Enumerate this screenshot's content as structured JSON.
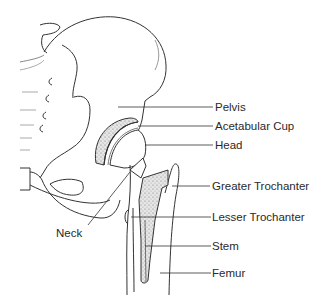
{
  "diagram": {
    "labels": [
      {
        "id": "pelvis",
        "text": "Pelvis"
      },
      {
        "id": "acetabular-cup",
        "text": "Acetabular Cup"
      },
      {
        "id": "head",
        "text": "Head"
      },
      {
        "id": "greater-trochanter",
        "text": "Greater Trochanter"
      },
      {
        "id": "lesser-trochanter",
        "text": "Lesser Trochanter"
      },
      {
        "id": "stem",
        "text": "Stem"
      },
      {
        "id": "femur",
        "text": "Femur"
      },
      {
        "id": "neck",
        "text": "Neck"
      }
    ],
    "colors": {
      "line": "#333333",
      "stipple": "#9a9a9a",
      "background": "#ffffff"
    }
  }
}
